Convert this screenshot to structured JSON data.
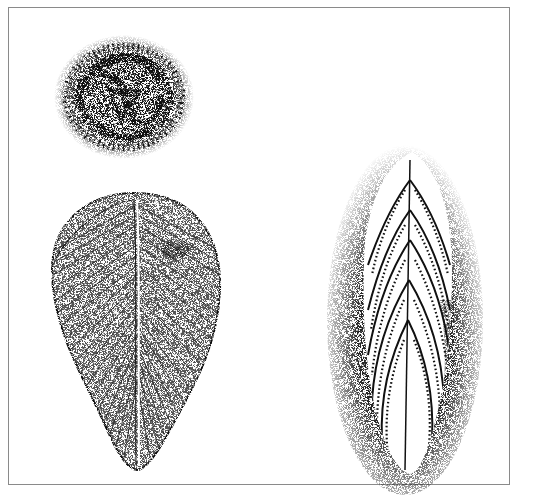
{
  "illustration": {
    "type": "stipple drawing",
    "subject": "fossil specimens",
    "specimens": [
      {
        "id": "coiled-disc",
        "shape": "round coiled disc with radial ridges",
        "position": "top-left"
      },
      {
        "id": "oval-segmented",
        "shape": "ovate body with central midline and fine transverse ribs",
        "position": "bottom-left"
      },
      {
        "id": "frond",
        "shape": "elongate leaf-like frond with chevron branches",
        "position": "right"
      }
    ],
    "colors": {
      "ink": "#111111",
      "border": "#8a8a8a",
      "paper": "#ffffff"
    }
  },
  "caption": {
    "text": ""
  }
}
